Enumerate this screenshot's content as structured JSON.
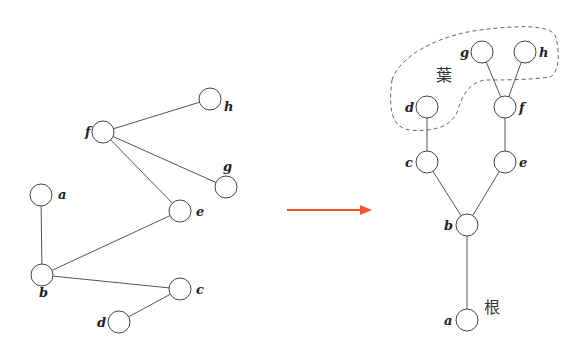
{
  "diagram": {
    "type": "graph-to-rooted-tree",
    "left_graph": {
      "nodes": [
        "a",
        "b",
        "c",
        "d",
        "e",
        "f",
        "g",
        "h"
      ],
      "edges": [
        [
          "a",
          "b"
        ],
        [
          "b",
          "e"
        ],
        [
          "b",
          "c"
        ],
        [
          "c",
          "d"
        ],
        [
          "e",
          "f"
        ],
        [
          "f",
          "g"
        ],
        [
          "f",
          "h"
        ]
      ]
    },
    "right_tree": {
      "root": "a",
      "nodes": [
        "a",
        "b",
        "c",
        "d",
        "e",
        "f",
        "g",
        "h"
      ],
      "edges": [
        [
          "a",
          "b"
        ],
        [
          "b",
          "c"
        ],
        [
          "b",
          "e"
        ],
        [
          "c",
          "d"
        ],
        [
          "e",
          "f"
        ],
        [
          "f",
          "g"
        ],
        [
          "f",
          "h"
        ]
      ],
      "leaves": [
        "d",
        "g",
        "h"
      ]
    },
    "labels": {
      "leaf": "葉",
      "root": "根"
    },
    "arrow_color": "#f0582a"
  }
}
